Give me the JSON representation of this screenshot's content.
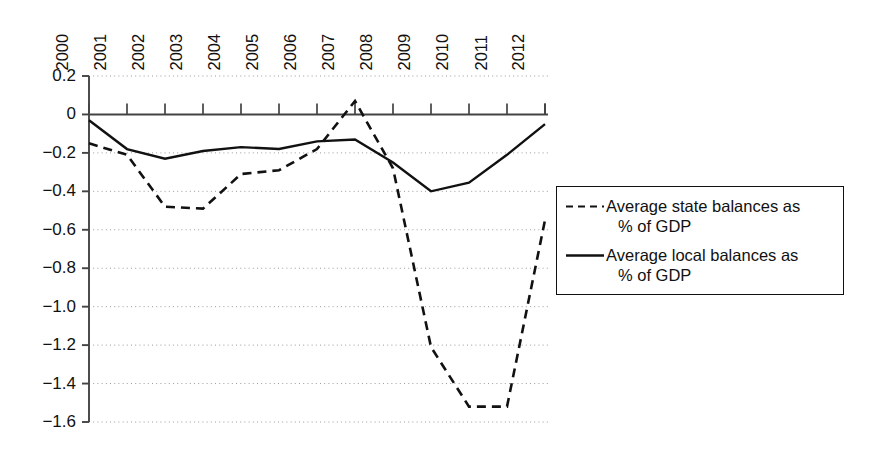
{
  "chart_data": {
    "type": "line",
    "title": "",
    "subtitle": "",
    "xlabel": "",
    "ylabel": "",
    "categories": [
      "2000",
      "2001",
      "2002",
      "2003",
      "2004",
      "2005",
      "2006",
      "2007",
      "2008",
      "2009",
      "2010",
      "2011",
      "2012"
    ],
    "x": [
      2000,
      2001,
      2002,
      2003,
      2004,
      2005,
      2006,
      2007,
      2008,
      2009,
      2010,
      2011,
      2012
    ],
    "series": [
      {
        "name": "Average state balances as % of GDP",
        "style": "dashed",
        "color": "#111111",
        "values": [
          -0.15,
          -0.21,
          -0.48,
          -0.49,
          -0.31,
          -0.29,
          -0.18,
          0.07,
          -0.28,
          -1.21,
          -1.52,
          -1.52,
          -0.55
        ]
      },
      {
        "name": "Average local balances as % of GDP",
        "style": "solid",
        "color": "#111111",
        "values": [
          -0.03,
          -0.18,
          -0.23,
          -0.19,
          -0.17,
          -0.18,
          -0.14,
          -0.13,
          -0.25,
          -0.4,
          -0.355,
          -0.21,
          -0.05
        ]
      }
    ],
    "ylim": [
      -1.6,
      0.2
    ],
    "xlim": [
      2000,
      2012
    ],
    "yticks": [
      0.2,
      0,
      -0.2,
      -0.4,
      -0.6,
      -0.8,
      -1.0,
      -1.2,
      -1.4,
      -1.6
    ],
    "ytick_labels": [
      "0.2",
      "0",
      "−0.2",
      "−0.4",
      "−0.6",
      "−0.8",
      "−1.0",
      "−1.2",
      "−1.4",
      "−1.6"
    ],
    "grid": "horizontal-dotted",
    "zero_line": true,
    "legend_position": "right"
  },
  "legend": {
    "entries": [
      {
        "key_style": "dashed",
        "line1": "Average state balances as",
        "line2": "% of GDP"
      },
      {
        "key_style": "solid",
        "line1": "Average local balances as",
        "line2": "% of GDP"
      }
    ]
  },
  "colors": {
    "line": "#111111",
    "axis": "#444444",
    "grid": "#9a9a9a",
    "background": "#ffffff"
  }
}
